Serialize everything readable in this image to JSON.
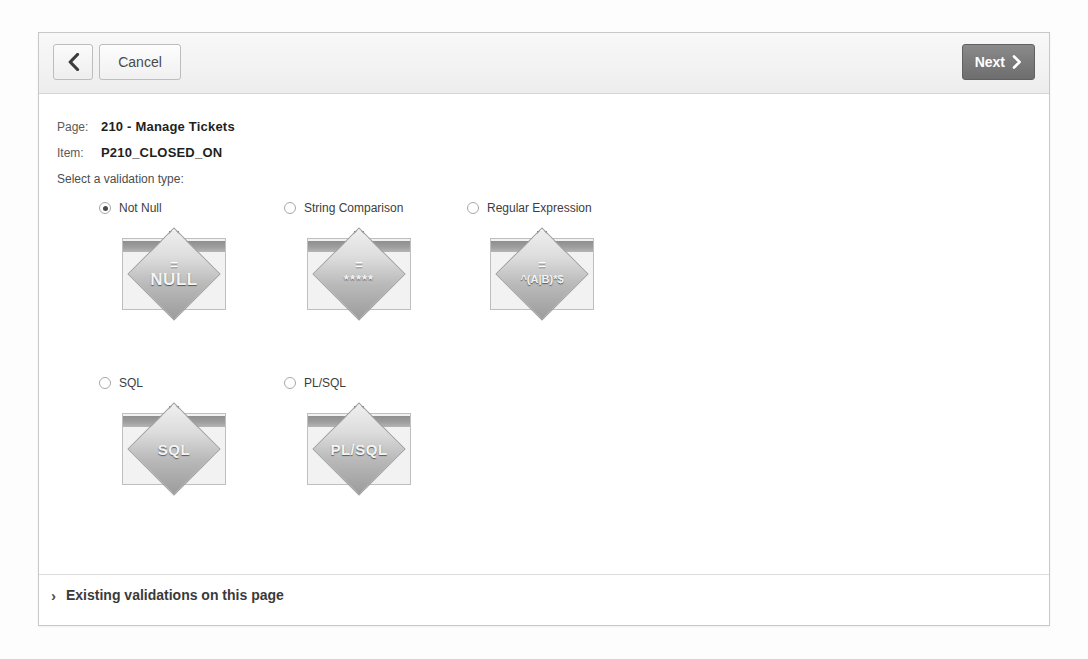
{
  "header": {
    "back_button": "",
    "cancel_label": "Cancel",
    "next_label": "Next"
  },
  "info": {
    "page_label": "Page:",
    "page_value": "210 - Manage Tickets",
    "item_label": "Item:",
    "item_value": "P210_CLOSED_ON",
    "prompt": "Select a validation type:"
  },
  "options": [
    {
      "label": "Not Null",
      "selected": true,
      "icon_eq": "=",
      "icon_word": "NULL",
      "icon_style": "normal"
    },
    {
      "label": "String Comparison",
      "selected": false,
      "icon_eq": "=",
      "icon_word": "*****",
      "icon_style": "stars"
    },
    {
      "label": "Regular Expression",
      "selected": false,
      "icon_eq": "=",
      "icon_word": "^(A|B)*$",
      "icon_style": "small"
    },
    {
      "label": "SQL",
      "selected": false,
      "icon_eq": "",
      "icon_word": "SQL",
      "icon_style": "wide"
    },
    {
      "label": "PL/SQL",
      "selected": false,
      "icon_eq": "",
      "icon_word": "PL/SQL",
      "icon_style": "wide"
    }
  ],
  "footer": {
    "chevron": "›",
    "existing_validations_label": "Existing validations on this page"
  },
  "colors": {
    "dialog_border": "#c8c8c8",
    "header_bg": "#f2f2f2",
    "next_button_bg": "#7b7b7b",
    "text_primary": "#1f1f1f",
    "text_secondary": "#5a5a5a",
    "icon_band": "#9e9e9e"
  }
}
